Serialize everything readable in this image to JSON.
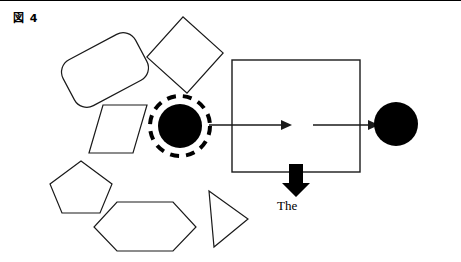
{
  "figure": {
    "caption": "図 4",
    "caption_label_kanji": "図",
    "caption_number": "4"
  },
  "labels": {
    "the": "The"
  },
  "colors": {
    "stroke": "#1a1a1a",
    "fill_black": "#000000",
    "background": "#ffffff",
    "shape_fill": "none"
  },
  "diagram": {
    "type": "shape-diagram",
    "frame_border_top": true,
    "shapes": [
      {
        "name": "rounded-rectangle",
        "kind": "rounded-rect",
        "x": 64,
        "y": 43,
        "width": 82,
        "height": 52,
        "corner_radius": 14,
        "rotation": -28,
        "fill": "none",
        "stroke_width": 1.2
      },
      {
        "name": "rotated-square",
        "kind": "square",
        "x": 158,
        "y": 27,
        "width": 54,
        "height": 54,
        "rotation": 42,
        "fill": "none",
        "stroke_width": 1.2
      },
      {
        "name": "parallelogram",
        "kind": "parallelogram",
        "points": "103,104 147,104 133,152 89,152",
        "fill": "none",
        "stroke_width": 1.2
      },
      {
        "name": "pentagon",
        "kind": "pentagon",
        "points": "81,160 112,183 100,212 62,212 50,183",
        "fill": "none",
        "stroke_width": 1.2
      },
      {
        "name": "hexagon",
        "kind": "hexagon",
        "points": "117,201 173,201 196,226 173,250 117,250 94,226",
        "fill": "none",
        "stroke_width": 1.2
      },
      {
        "name": "triangle",
        "kind": "triangle",
        "points": "209,190 248,218 214,246",
        "fill": "none",
        "stroke_width": 1.2
      },
      {
        "name": "dashed-circle-outline",
        "kind": "circle-dashed",
        "cx": 180,
        "cy": 125,
        "r": 30,
        "fill": "none",
        "stroke_width": 4,
        "dash": "9 7"
      },
      {
        "name": "filled-circle-left",
        "kind": "circle-filled",
        "cx": 180,
        "cy": 125,
        "r": 22,
        "fill": "#000000"
      },
      {
        "name": "main-rectangle",
        "kind": "rect",
        "x": 232,
        "y": 59,
        "width": 128,
        "height": 112,
        "fill": "none",
        "stroke_width": 1.4
      },
      {
        "name": "filled-circle-right",
        "kind": "circle-filled",
        "cx": 396,
        "cy": 123,
        "r": 22,
        "fill": "#000000"
      }
    ],
    "connectors": [
      {
        "name": "arrow-circle-to-rectangle",
        "kind": "arrow-right",
        "x1": 209,
        "y1": 124,
        "x2": 285,
        "y2": 124,
        "stroke_width": 1.4,
        "head": "solid-triangle"
      },
      {
        "name": "arrow-rectangle-to-circle",
        "kind": "arrow-right",
        "x1": 313,
        "y1": 124,
        "x2": 373,
        "y2": 124,
        "stroke_width": 1.4,
        "head": "solid-triangle"
      },
      {
        "name": "arrow-down-block",
        "kind": "block-arrow-down",
        "cx": 296,
        "y_top": 163,
        "y_bottom": 196,
        "shaft_width": 14,
        "head_width": 28,
        "fill": "#000000"
      }
    ]
  }
}
